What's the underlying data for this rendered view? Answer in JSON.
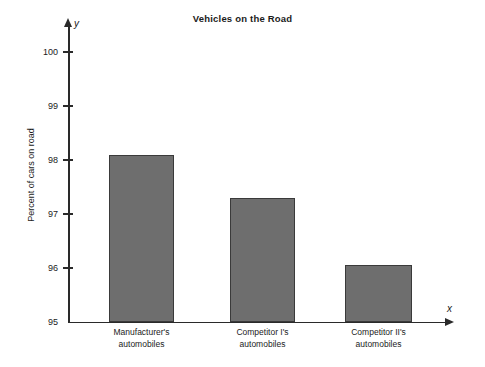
{
  "chart_data": {
    "type": "bar",
    "title": "Vehicles on the Road",
    "xlabel": "x",
    "ylabel": "Percent of cars on road",
    "y_axis_variable": "y",
    "x_axis_variable": "x",
    "categories": [
      "Manufacturer's\nautomobiles",
      "Competitor I's\nautomobiles",
      "Competitor II's\nautomobiles"
    ],
    "category_lines": [
      [
        "Manufacturer's",
        "automobiles"
      ],
      [
        "Competitor I's",
        "automobiles"
      ],
      [
        "Competitor II's",
        "automobiles"
      ]
    ],
    "values": [
      98.1,
      97.3,
      96.05
    ],
    "ylim": [
      95,
      100.2
    ],
    "yticks": [
      100,
      99,
      98,
      97,
      96,
      95
    ],
    "ytick_labels": [
      "100",
      "99",
      "98",
      "97",
      "96",
      "95"
    ],
    "grid": false,
    "legend": false,
    "bar_color": "#6e6e6e",
    "bar_edge_color": "#3a3a3a",
    "axis_color": "#2a2a2a",
    "text_color": "#1b1b1b",
    "background": "#ffffff"
  }
}
